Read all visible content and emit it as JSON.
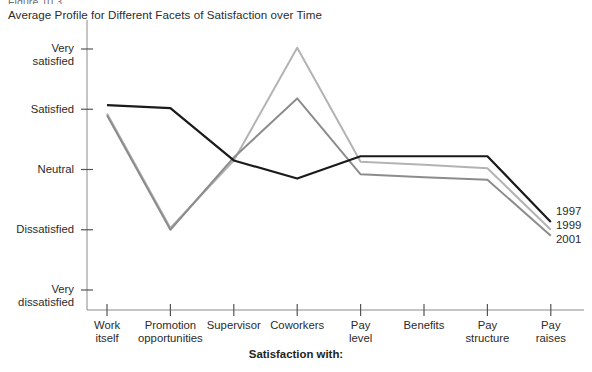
{
  "figure_label": "Figure 10.3",
  "title": "Average Profile for Different Facets of Satisfaction over Time",
  "xaxis_title": "Satisfaction with:",
  "y_tick_labels": [
    {
      "line1": "Very",
      "line2": "satisfied"
    },
    {
      "line1": "Satisfied",
      "line2": ""
    },
    {
      "line1": "Neutral",
      "line2": ""
    },
    {
      "line1": "Dissatisfied",
      "line2": ""
    },
    {
      "line1": "Very",
      "line2": "dissatisfied"
    }
  ],
  "x_tick_labels": [
    {
      "line1": "Work",
      "line2": "itself"
    },
    {
      "line1": "Promotion",
      "line2": "opportunities"
    },
    {
      "line1": "Supervisor",
      "line2": ""
    },
    {
      "line1": "Coworkers",
      "line2": ""
    },
    {
      "line1": "Pay",
      "line2": "level"
    },
    {
      "line1": "Benefits",
      "line2": ""
    },
    {
      "line1": "Pay",
      "line2": "structure"
    },
    {
      "line1": "Pay",
      "line2": "raises"
    }
  ],
  "series_colors": {
    "1997": "#1a1a1a",
    "1999": "#b3b3b3",
    "2001": "#8c8c8c"
  },
  "chart_data": {
    "type": "line",
    "title": "Average Profile for Different Facets of Satisfaction over Time",
    "xlabel": "Satisfaction with:",
    "ylabel": "",
    "grid": false,
    "legend_position": "right-inline-end-of-line",
    "categories": [
      "Work itself",
      "Promotion opportunities",
      "Supervisor",
      "Coworkers",
      "Pay level",
      "Benefits",
      "Pay structure",
      "Pay raises"
    ],
    "y_tick_labels": [
      "Very satisfied",
      "Satisfied",
      "Neutral",
      "Dissatisfied",
      "Very dissatisfied"
    ],
    "y_tick_values": [
      5,
      4,
      3,
      2,
      1
    ],
    "ylim": [
      1,
      5
    ],
    "series": [
      {
        "name": "1997",
        "values": [
          4.07,
          4.02,
          3.15,
          2.85,
          3.22,
          3.22,
          3.22,
          2.13
        ]
      },
      {
        "name": "1999",
        "values": [
          3.93,
          2.03,
          3.15,
          5.02,
          3.13,
          3.08,
          3.02,
          2.0
        ]
      },
      {
        "name": "2001",
        "values": [
          3.9,
          2.0,
          3.2,
          4.18,
          2.92,
          2.87,
          2.83,
          1.9
        ]
      }
    ]
  }
}
